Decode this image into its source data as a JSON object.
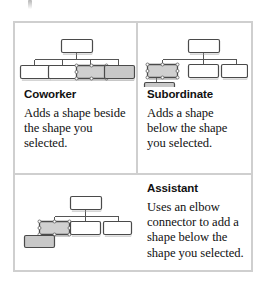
{
  "figure": {
    "artifact_icon": "scan-speck-artifact"
  },
  "panels": [
    {
      "id": "coworker",
      "heading": "Coworker",
      "description": "Adds a shape beside the shape you selected.",
      "diagram_name": "coworker-org-chart-diagram",
      "diagram_alt": "Org chart with a top shape and four shapes below it; the third shape is selected and a new shaded shape is added beside it."
    },
    {
      "id": "subordinate",
      "heading": "Subordinate",
      "description": "Adds a shape below the shape you selected.",
      "diagram_name": "subordinate-org-chart-diagram",
      "diagram_alt": "Org chart with a top shape and three shapes below it; the first shape is selected and a new shaded shape is added below it."
    },
    {
      "id": "assistant",
      "heading": "Assistant",
      "description": "Uses an elbow connector to add a shape below the shape you selected.",
      "diagram_name": "assistant-org-chart-diagram",
      "diagram_alt": "Org chart with a top shape and three shapes below it; the first shape is selected and a new shaded shape is attached with an elbow connector below and to the left."
    }
  ],
  "colors": {
    "table_border": "#cfcfcf",
    "shape_stroke": "#4a4a4a",
    "shape_fill": "#ffffff",
    "shape_fill_new": "#c8c8c8",
    "shape_fill_selected": "#d0d0d0",
    "connector": "#555555",
    "handle": "#808080",
    "text": "#111111",
    "background": "#ffffff"
  }
}
